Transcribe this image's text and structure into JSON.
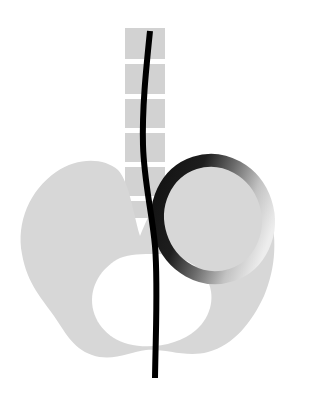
{
  "document": {
    "title": "Abstract Figure",
    "width": 310,
    "height": 400,
    "background_color": "#ffffff",
    "description": "Abstract black-and-gray vector illustration: a segmented vertical gray band descends from the top into a large light-gray winged blob containing a white elliptical opening, a tilted ring with a black-to-light gradient stroke overlaps at the right, and a single black curved line runs from top to bottom through the whole composition."
  },
  "palette": {
    "background": "#ffffff",
    "blob_gray": "#d7d7d7",
    "band_gray": "#d2d2d2",
    "band_gap_white": "#ffffff",
    "ring_dark": "#1c1c1c",
    "ring_mid": "#6e6e6e",
    "ring_light": "#c9c9c9",
    "ring_palest": "#ededed",
    "line_black": "#000000",
    "hole_white": "#ffffff"
  },
  "shapes": {
    "vertical_band": {
      "name": "segmented-vertical-band",
      "x": 125,
      "y": 28,
      "width": 40,
      "height": 190,
      "fill": "#d2d2d2",
      "gap_color": "#ffffff",
      "gap_height": 5,
      "gap_positions": [
        59,
        94,
        128,
        162,
        196
      ],
      "segments": 6
    },
    "blob": {
      "name": "winged-blob",
      "fill": "#d7d7d7",
      "bounds": {
        "x": 18,
        "y": 160,
        "width": 258,
        "height": 198
      },
      "path": "M 118 170 C 104 158 78 157 56 172 C 30 190 16 222 22 254 C 27 284 43 300 54 316 C 64 330 72 348 92 355 C 112 362 130 352 146 350 C 164 348 186 358 208 352 C 234 345 252 322 264 296 C 276 268 278 236 268 206 C 258 178 236 163 212 164 C 190 165 172 178 160 196 C 150 211 144 226 140 236 C 136 224 132 200 126 184 C 123 177 121 173 118 170 Z"
    },
    "blob_hole": {
      "name": "blob-white-opening",
      "fill": "#ffffff",
      "path": "M 120 258 C 104 266 92 282 92 300 C 92 320 106 338 128 344 C 152 350 180 344 196 330 C 212 316 216 294 206 278 C 196 262 176 254 156 254 C 142 254 130 254 120 258 Z"
    },
    "ring": {
      "name": "gradient-ring",
      "center_x": 213,
      "center_y": 219,
      "radius_x": 55,
      "radius_y": 59,
      "rotation_deg": -18,
      "stroke_width": 13,
      "gradient_stops": [
        {
          "offset": 0.0,
          "color": "#121212"
        },
        {
          "offset": 0.32,
          "color": "#1e1e1e"
        },
        {
          "offset": 0.55,
          "color": "#6b6b6b"
        },
        {
          "offset": 0.78,
          "color": "#c2c2c2"
        },
        {
          "offset": 1.0,
          "color": "#ededed"
        }
      ]
    },
    "black_curve": {
      "name": "black-vertical-curve",
      "stroke": "#000000",
      "stroke_width": 6,
      "path": "M 150 31 C 146 70 142 108 143 145 C 144 182 152 212 155 246 C 158 282 156 320 155 378",
      "start_y": 31,
      "end_y": 378
    }
  }
}
